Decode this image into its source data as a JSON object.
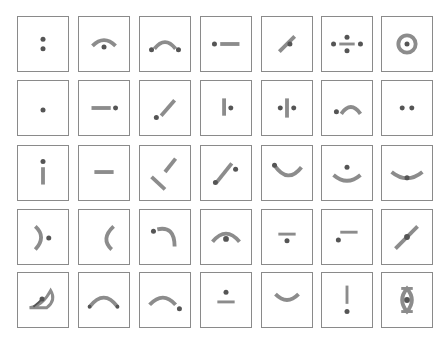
{
  "colors": {
    "border": "#8a8a8a",
    "stroke": "#8c8c8c",
    "dot": "#555555"
  },
  "grid": {
    "rows": 5,
    "cols": 7
  },
  "cells": [
    {
      "name": "two-dots-vertical-glyph"
    },
    {
      "name": "arc-over-dot-glyph"
    },
    {
      "name": "dot-arc-dot-glyph"
    },
    {
      "name": "dot-dash-glyph"
    },
    {
      "name": "diagonal-bar-with-dot-glyph"
    },
    {
      "name": "division-with-side-dots-glyph"
    },
    {
      "name": "ring-with-dot-glyph"
    },
    {
      "name": "single-dot-glyph"
    },
    {
      "name": "dash-dot-glyph"
    },
    {
      "name": "dot-diagonal-bar-glyph"
    },
    {
      "name": "vertical-bar-dot-glyph"
    },
    {
      "name": "dot-vertical-bar-dot-glyph"
    },
    {
      "name": "dot-arc-glyph"
    },
    {
      "name": "two-dots-horizontal-glyph"
    },
    {
      "name": "dot-over-vertical-bar-glyph"
    },
    {
      "name": "horizontal-dash-glyph"
    },
    {
      "name": "two-crossed-bars-glyph"
    },
    {
      "name": "diagonal-bar-dot-glyph"
    },
    {
      "name": "dot-smile-arc-glyph"
    },
    {
      "name": "dot-over-smile-glyph"
    },
    {
      "name": "smile-with-center-dot-glyph"
    },
    {
      "name": "right-paren-dot-glyph"
    },
    {
      "name": "left-paren-glyph"
    },
    {
      "name": "dot-quarter-arc-glyph"
    },
    {
      "name": "arc-over-center-dot-glyph"
    },
    {
      "name": "dash-over-dot-glyph"
    },
    {
      "name": "dash-dot-below-left-glyph"
    },
    {
      "name": "diagonal-bar-center-dot-glyph"
    },
    {
      "name": "half-eye-glyph"
    },
    {
      "name": "arch-glyph"
    },
    {
      "name": "arch-dot-glyph"
    },
    {
      "name": "dot-over-dash-glyph"
    },
    {
      "name": "smile-glyph"
    },
    {
      "name": "exclamation-glyph"
    },
    {
      "name": "ornate-eye-glyph"
    }
  ]
}
